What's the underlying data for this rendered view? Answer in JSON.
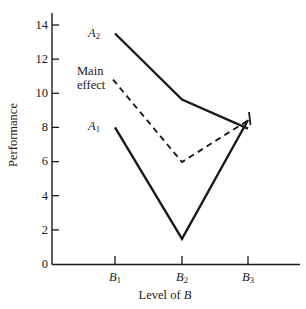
{
  "chart_data": {
    "type": "line",
    "title": "",
    "xlabel": "Level of B",
    "ylabel": "Performance",
    "grid": false,
    "legend": "inline-labels",
    "xlim": [
      0,
      4
    ],
    "ylim": [
      0,
      15
    ],
    "categories": [
      "B1",
      "B2",
      "B3"
    ],
    "category_labels_html": [
      "B<sub>1</sub>",
      "B<sub>2</sub>",
      "B<sub>3</sub>"
    ],
    "y_ticks": [
      0,
      2,
      4,
      6,
      8,
      10,
      12,
      14
    ],
    "y_tick_labels": [
      "0",
      "2",
      "4",
      "6",
      "8",
      "10",
      "12",
      "14"
    ],
    "series": [
      {
        "name": "A2",
        "label_html": "A<sub>2</sub>",
        "style": "solid",
        "values": [
          13.5,
          10.1,
          8.4
        ]
      },
      {
        "name": "Main effect",
        "label_line1": "Main",
        "label_line2": "effect",
        "style": "dashed",
        "values": [
          10.8,
          5.7,
          8.4
        ]
      },
      {
        "name": "A1",
        "label_html": "A<sub>1</sub>",
        "style": "solid",
        "values": [
          8.0,
          1.5,
          8.4
        ]
      }
    ],
    "annotations": [
      {
        "name": "a2-label",
        "text": "A2",
        "x": 0.72,
        "y": 13.6
      },
      {
        "name": "main-effect-label",
        "text": "Main effect",
        "x": 0.35,
        "y": 11.4
      },
      {
        "name": "a1-label",
        "text": "A1",
        "x": 0.72,
        "y": 8.2
      }
    ],
    "colors": {
      "line": "#1a1a1a",
      "axis": "#1a1a1a",
      "background": "#ffffff"
    }
  },
  "axes": {
    "y_title": "Performance",
    "x_title_prefix": "Level of ",
    "x_title_var": "B"
  },
  "ticks": {
    "y": [
      "14",
      "12",
      "10",
      "8",
      "6",
      "4",
      "2",
      "0"
    ]
  }
}
